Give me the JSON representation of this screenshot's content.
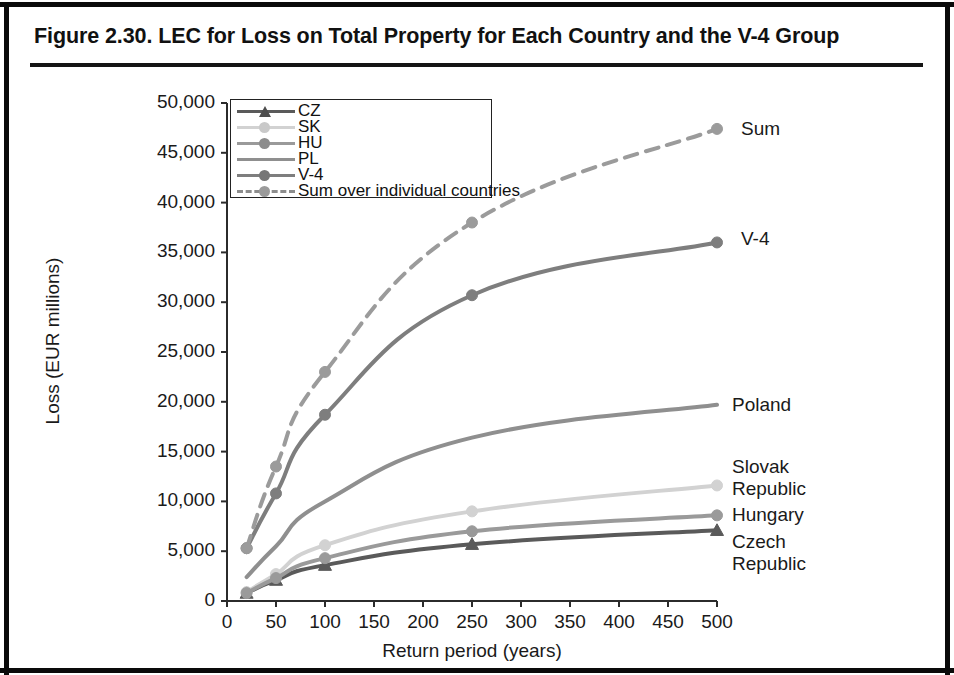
{
  "figure": {
    "title": "Figure 2.30. LEC for Loss on Total Property for Each Country and the V-4 Group"
  },
  "chart_data": {
    "type": "line",
    "title": "Figure 2.30. LEC for Loss on Total Property for Each Country and the V-4 Group",
    "xlabel": "Return period (years)",
    "ylabel": "Loss (EUR millions)",
    "xlim": [
      0,
      500
    ],
    "ylim": [
      0,
      50000
    ],
    "xticks": [
      0,
      50,
      100,
      150,
      200,
      250,
      300,
      350,
      400,
      450,
      500
    ],
    "xtick_labels": [
      "0",
      "50",
      "100",
      "150",
      "200",
      "250",
      "300",
      "350",
      "400",
      "450",
      "500"
    ],
    "yticks": [
      0,
      5000,
      10000,
      15000,
      20000,
      25000,
      30000,
      35000,
      40000,
      45000,
      50000
    ],
    "ytick_labels": [
      "0",
      "5,000",
      "10,000",
      "15,000",
      "20,000",
      "25,000",
      "30,000",
      "35,000",
      "40,000",
      "45,000",
      "50,000"
    ],
    "grid": false,
    "legend_position": "upper-left-inside",
    "x": [
      20,
      50,
      100,
      250,
      500
    ],
    "series": [
      {
        "name": "CZ",
        "right_label": "Czech Republic",
        "color": "#5a5a5a",
        "marker": "triangle",
        "linestyle": "solid",
        "values": [
          800,
          2100,
          3600,
          5700,
          7100
        ]
      },
      {
        "name": "SK",
        "right_label": "Slovak Republic",
        "color": "#d2d2d2",
        "marker": "circle",
        "linestyle": "solid",
        "values": [
          900,
          2700,
          5600,
          9000,
          11600
        ]
      },
      {
        "name": "HU",
        "right_label": "Hungary",
        "color": "#9a9a9a",
        "marker": "circle",
        "linestyle": "solid",
        "values": [
          800,
          2300,
          4300,
          7000,
          8600
        ]
      },
      {
        "name": "PL",
        "right_label": "Poland",
        "color": "#8f8f8f",
        "marker": "none",
        "linestyle": "solid",
        "values": [
          2400,
          5500,
          10000,
          16400,
          19700
        ]
      },
      {
        "name": "V-4",
        "right_label": "V-4",
        "color": "#7e7e7e",
        "marker": "circle",
        "linestyle": "solid",
        "values": [
          5300,
          10800,
          18700,
          30700,
          36000
        ]
      },
      {
        "name": "Sum over individual countries",
        "right_label": "Sum",
        "color": "#9b9b9b",
        "marker": "circle",
        "linestyle": "dashed",
        "values": [
          5300,
          13500,
          23000,
          38000,
          47400
        ]
      }
    ]
  },
  "legend": {
    "items": [
      {
        "label": "CZ"
      },
      {
        "label": "SK"
      },
      {
        "label": "HU"
      },
      {
        "label": "PL"
      },
      {
        "label": "V-4"
      },
      {
        "label": "Sum over individual countries"
      }
    ]
  },
  "right_labels": {
    "sum": "Sum",
    "v4": "V-4",
    "poland": "Poland",
    "slovak_line1": "Slovak",
    "slovak_line2": "Republic",
    "hungary": "Hungary",
    "czech_line1": "Czech",
    "czech_line2": "Republic"
  }
}
